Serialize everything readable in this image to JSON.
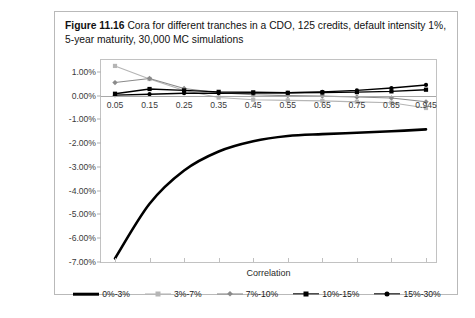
{
  "caption": {
    "label": "Figure 11.16",
    "text": "Cora for different tranches in a CDO, 125 credits, default intensity 1%, 5-year maturity, 30,000 MC simulations"
  },
  "chart_data": {
    "type": "line",
    "title": "",
    "xlabel": "Correlation",
    "ylabel": "",
    "categories": [
      "0.05",
      "0.15",
      "0.25",
      "0.35",
      "0.45",
      "0.55",
      "0.65",
      "0.75",
      "0.85",
      "0.945"
    ],
    "ylim": [
      -7.0,
      1.5
    ],
    "yticks": [
      "1.00%",
      "0.00%",
      "-1.00%",
      "-2.00%",
      "-3.00%",
      "-4.00%",
      "-5.00%",
      "-6.00%",
      "-7.00%"
    ],
    "ytick_values": [
      1.0,
      0.0,
      -1.0,
      -2.0,
      -3.0,
      -4.0,
      -5.0,
      -6.0,
      -7.0
    ],
    "grid": false,
    "legend_position": "bottom",
    "series": [
      {
        "name": "0%-3%",
        "color": "#000000",
        "marker": "none",
        "width": 2.6,
        "values": [
          -6.85,
          -4.55,
          -3.15,
          -2.35,
          -1.92,
          -1.7,
          -1.62,
          -1.56,
          -1.5,
          -1.42
        ]
      },
      {
        "name": "3%-7%",
        "color": "#b5b5b5",
        "marker": "square",
        "width": 1.1,
        "values": [
          1.25,
          0.7,
          0.22,
          -0.08,
          -0.17,
          -0.2,
          -0.22,
          -0.26,
          -0.3,
          -0.52
        ]
      },
      {
        "name": "7%-10%",
        "color": "#8a8a8a",
        "marker": "diamond",
        "width": 1.1,
        "values": [
          0.55,
          0.72,
          0.3,
          0.12,
          0.04,
          0.0,
          -0.02,
          -0.06,
          -0.1,
          -0.26
        ]
      },
      {
        "name": "10%-15%",
        "color": "#000000",
        "marker": "square",
        "width": 1.4,
        "values": [
          0.08,
          0.28,
          0.22,
          0.16,
          0.14,
          0.12,
          0.13,
          0.15,
          0.18,
          0.25
        ]
      },
      {
        "name": "15%-30%",
        "color": "#000000",
        "marker": "circle",
        "width": 1.4,
        "values": [
          0.02,
          0.06,
          0.1,
          0.1,
          0.11,
          0.12,
          0.16,
          0.22,
          0.32,
          0.45
        ]
      }
    ]
  }
}
